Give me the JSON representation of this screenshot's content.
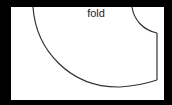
{
  "diagram": {
    "label": "fold",
    "colors": {
      "background": "#000000",
      "panel": "#ffffff",
      "stroke": "#333333",
      "text": "#222222"
    }
  }
}
